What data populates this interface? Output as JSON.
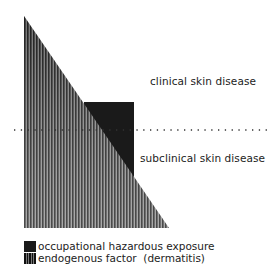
{
  "diagram": {
    "labels": {
      "clinical": "clinical skin disease",
      "subclinical": "subclinical skin disease"
    },
    "threshold_line": "dotted horizontal threshold",
    "shapes": {
      "triangle": "endogenous factor (dermatitis)",
      "rectangle": "occupational hazardous exposure"
    },
    "colors": {
      "solid": "#1a1a1a",
      "stripe_dark": "#111111",
      "stripe_light": "#8a8a8a"
    }
  },
  "legend": {
    "items": [
      {
        "label": "occupational hazardous exposure",
        "pattern": "solid"
      },
      {
        "label": "endogenous factor  (dermatitis)",
        "pattern": "striped"
      }
    ]
  }
}
